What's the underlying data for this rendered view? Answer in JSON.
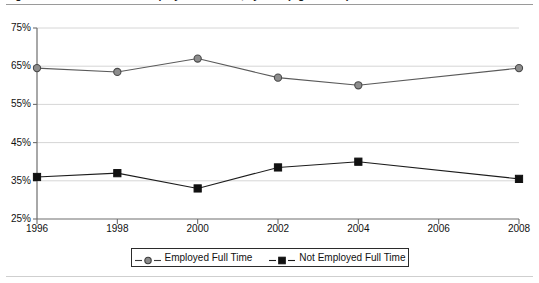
{
  "figure": {
    "title": "Figure 1. Percent of Adults Employed Full Time, by Year (Ages 25-64)",
    "title_clipped": true
  },
  "legend": {
    "position": "bottom-center",
    "entries": [
      {
        "label": "Employed Full Time",
        "marker": "circle-marker",
        "color": "#808080"
      },
      {
        "label": "Not Employed Full Time",
        "marker": "square-marker",
        "color": "#111111"
      }
    ]
  },
  "axes": {
    "y_ticks": [
      "75%",
      "65%",
      "55%",
      "45%",
      "35%",
      "25%"
    ],
    "x_ticks": [
      "1996",
      "1998",
      "2000",
      "2002",
      "2004",
      "2006",
      "2008"
    ]
  },
  "chart_data": {
    "type": "line",
    "title": "Figure 1. Percent of Adults Employed Full Time, by Year (Ages 25-64)",
    "xlabel": "",
    "ylabel": "",
    "x": [
      1996,
      1998,
      2000,
      2002,
      2004,
      2008
    ],
    "categories": [
      "1996",
      "1998",
      "2000",
      "2002",
      "2004",
      "2008"
    ],
    "xlim": [
      1996,
      2008
    ],
    "ylim": [
      25,
      75
    ],
    "ytick_values": [
      75,
      65,
      55,
      45,
      35,
      25
    ],
    "ytick_labels": [
      "75%",
      "65%",
      "55%",
      "45%",
      "35%",
      "25%"
    ],
    "xtick_values": [
      1996,
      1998,
      2000,
      2002,
      2004,
      2006,
      2008
    ],
    "xtick_labels": [
      "1996",
      "1998",
      "2000",
      "2002",
      "2004",
      "2006",
      "2008"
    ],
    "grid": "horizontal",
    "legend_position": "bottom-center",
    "units": "percent",
    "series": [
      {
        "name": "Employed Full Time",
        "marker": "circle",
        "color": "#808080",
        "values": [
          64.5,
          63.5,
          67.0,
          62.0,
          60.0,
          64.5
        ]
      },
      {
        "name": "Not Employed Full Time",
        "marker": "square",
        "color": "#111111",
        "values": [
          36.0,
          37.0,
          33.0,
          38.5,
          40.0,
          35.5
        ]
      }
    ]
  }
}
